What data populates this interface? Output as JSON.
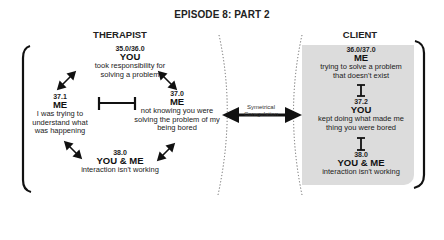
{
  "title": "EPISODE 8: PART 2",
  "therapist": {
    "heading": "THERAPIST",
    "nodes": [
      {
        "num": "35.0/36.0",
        "who": "YOU",
        "desc": "took responsibility for solving a problem"
      },
      {
        "num": "37.1",
        "who": "ME",
        "desc": "I was trying to understand what was happening"
      },
      {
        "num": "37.0",
        "who": "ME",
        "desc": "not knowing you were solving the problem of my being bored"
      },
      {
        "num": "38.0",
        "who": "YOU & ME",
        "desc": "interaction isn't working"
      }
    ]
  },
  "client": {
    "heading": "CLIENT",
    "box_color": "#dcdcdc",
    "nodes": [
      {
        "num": "36.0/37.0",
        "who": "ME",
        "desc": "trying to solve a problem that doesn't exist"
      },
      {
        "num": "37.2",
        "who": "YOU",
        "desc": "kept doing what made me thing you were bored"
      },
      {
        "num": "38.0",
        "who": "YOU & ME",
        "desc": "interaction isn't working"
      }
    ]
  },
  "connector": {
    "label_line1": "Symetrical",
    "label_line2": "Coregulation"
  },
  "icons": {
    "double_arrow": "double-headed-arrow",
    "blocked": "blocked-bar",
    "vertical_double_arrow": "vertical-double-arrow"
  }
}
